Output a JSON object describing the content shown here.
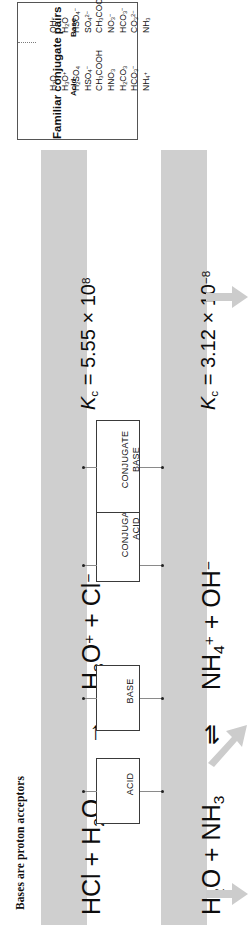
{
  "figure": {
    "section_title": "Bases are proton acceptors",
    "orientation": "rotated-90-ccw"
  },
  "conjugate_table": {
    "title": "Familiar conjugate pairs",
    "columns": [
      "Acid",
      "Base"
    ],
    "rows": [
      {
        "acid": "H2O",
        "acid_html": "H<sub>2</sub>O",
        "base": "OH-",
        "base_html": "OH<sup>−</sup>"
      },
      {
        "acid": "H3O+",
        "acid_html": "H<sub>3</sub>O<sup>+</sup>",
        "base": "H2O",
        "base_html": "H<sub>2</sub>O"
      },
      {
        "acid": "H2SO4",
        "acid_html": "H<sub>2</sub>SO<sub>4</sub>",
        "base": "HSO4-",
        "base_html": "HSO<sub>4</sub><sup>−</sup>"
      },
      {
        "acid": "HSO4-",
        "acid_html": "HSO<sub>4</sub><sup>−</sup>",
        "base": "SO42-",
        "base_html": "SO<sub>4</sub><sup>2−</sup>"
      },
      {
        "acid": "CH3COOH",
        "acid_html": "CH<sub>3</sub>COOH",
        "base": "CH3COO-",
        "base_html": "CH<sub>3</sub>COO<sup>−</sup>"
      },
      {
        "acid": "HNO3",
        "acid_html": "HNO<sub>3</sub>",
        "base": "NO3-",
        "base_html": "NO<sub>3</sub><sup>−</sup>"
      },
      {
        "acid": "H2CO3",
        "acid_html": "H<sub>2</sub>CO<sub>3</sub>",
        "base": "HCO3-",
        "base_html": "HCO<sub>3</sub><sup>−</sup>"
      },
      {
        "acid": "HCO3-",
        "acid_html": "HCO<sub>3</sub><sup>−</sup>",
        "base": "CO32-",
        "base_html": "CO<sub>3</sub><sup>2−</sup>"
      },
      {
        "acid": "NH4+",
        "acid_html": "NH<sub>4</sub><sup>+</sup>",
        "base": "NH3",
        "base_html": "NH<sub>3</sub>"
      }
    ]
  },
  "reactions": [
    {
      "id": "reaction-hcl",
      "reactants_html": "HCl + H<sub>2</sub>O",
      "arrow": "→",
      "products_html": "H<sub>3</sub>O<sup>+</sup> + Cl<sup>−</sup>",
      "kc_html": "<i>K</i><sub>c</sub> = 5.55 × 10<sup>8</sup>",
      "kc_value": "5.55 × 10^8"
    },
    {
      "id": "reaction-ammonia",
      "reactants_html": "H<sub>2</sub>O + NH<sub>3</sub>",
      "arrow": "⇌",
      "products_html": "NH<sub>4</sub><sup>+</sup> + OH<sup>−</sup>",
      "kc_html": "<i>K</i><sub>c</sub> = 3.12 × 10<sup>−8</sup>",
      "kc_value": "3.12 × 10^-8"
    }
  ],
  "callouts": {
    "acid": "ACID",
    "base": "BASE",
    "conjugate_acid_line1": "CONJUGATE",
    "conjugate_acid_line2": "ACID",
    "conjugate_base_line1": "CONJUGATE",
    "conjugate_base_line2": "BASE"
  },
  "colors": {
    "band": "#cfcfcf",
    "arrow": "#cccccc",
    "text": "#101010",
    "box_border": "#3a3a3a"
  }
}
